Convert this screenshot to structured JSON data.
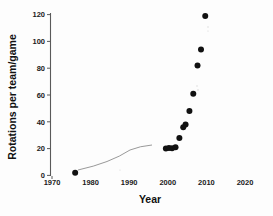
{
  "chart_data": {
    "type": "scatter",
    "title": "",
    "xlabel": "Year",
    "ylabel": "Rotations per team/game",
    "xlim": [
      1970,
      2022
    ],
    "ylim": [
      0,
      125
    ],
    "xticks": [
      1970,
      1980,
      1990,
      2000,
      2010,
      2020
    ],
    "xtick_labels": [
      "1970",
      "1980",
      "1990",
      "2000",
      "2010",
      "2020"
    ],
    "yticks": [
      0,
      20,
      40,
      60,
      80,
      100,
      120
    ],
    "ytick_labels": [
      "0",
      "20",
      "40",
      "60",
      "80",
      "100",
      "120"
    ],
    "grid": false,
    "legend": null,
    "marker": "filled-circle",
    "marker_color": "#111111",
    "points": [
      {
        "x": 1976,
        "y": 2
      },
      {
        "x": 1999.5,
        "y": 20
      },
      {
        "x": 2000.3,
        "y": 20.5
      },
      {
        "x": 2001.1,
        "y": 20.2
      },
      {
        "x": 2002.0,
        "y": 21
      },
      {
        "x": 2003.0,
        "y": 28
      },
      {
        "x": 2004.0,
        "y": 36
      },
      {
        "x": 2004.6,
        "y": 38
      },
      {
        "x": 2005.6,
        "y": 48
      },
      {
        "x": 2006.6,
        "y": 61
      },
      {
        "x": 2007.7,
        "y": 82
      },
      {
        "x": 2008.6,
        "y": 94
      },
      {
        "x": 2009.7,
        "y": 119
      }
    ],
    "trend_segment": {
      "description": "faint curve rising from first point toward 1990",
      "from": {
        "x": 1976,
        "y": 2
      },
      "to": {
        "x": 1991,
        "y": 20
      }
    }
  },
  "axes": {
    "y_axis_title": "Rotations per team/game",
    "x_axis_title": "Year"
  }
}
